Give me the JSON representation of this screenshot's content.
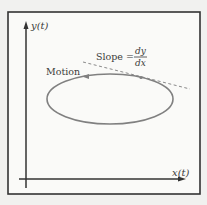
{
  "diagram": {
    "y_axis_label": "y(t)",
    "x_axis_label": "x(t)",
    "motion_label": "Motion",
    "slope_label": "Slope =",
    "slope_numerator": "dy",
    "slope_denominator": "dx",
    "colors": {
      "background": "#f1f1ef",
      "panel": "#fafaf8",
      "frame": "#333333",
      "axis": "#333333",
      "curve": "#808080",
      "tangent": "#8a8a8a",
      "text": "#3a3a3a"
    }
  }
}
